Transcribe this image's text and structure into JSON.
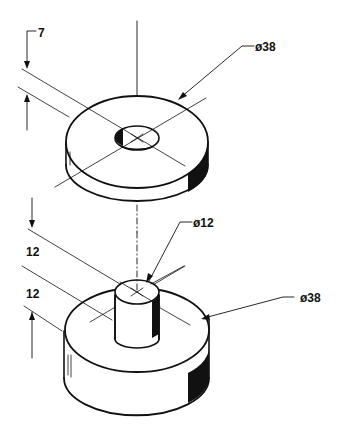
{
  "diagram": {
    "type": "isometric-engineering-drawing",
    "parts": [
      {
        "name": "washer",
        "dimensions": {
          "thickness": "7",
          "outer_diameter": "ø38"
        }
      },
      {
        "name": "stepped-pin",
        "dimensions": {
          "pin_height": "12",
          "base_height": "12",
          "pin_diameter": "ø12",
          "base_diameter": "ø38"
        }
      }
    ],
    "labels": {
      "washer_thickness": "7",
      "washer_diameter": "ø38",
      "pin_diameter": "ø12",
      "pin_height": "12",
      "base_height": "12",
      "base_diameter": "ø38"
    },
    "colors": {
      "line": "#111111",
      "background": "#ffffff"
    }
  }
}
